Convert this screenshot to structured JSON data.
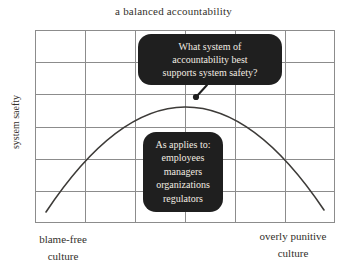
{
  "figure": {
    "title": "a balanced accountability",
    "y_axis_label": "system saefty",
    "x_axis_labels": {
      "left": [
        "blame-free",
        "culture"
      ],
      "right": [
        "overly punitive",
        "culture"
      ]
    },
    "callouts": {
      "question": {
        "lines": [
          "What system of",
          "accountability best",
          "supports system safety?"
        ]
      },
      "applies_to": {
        "lines": [
          "As applies to:",
          "employees",
          "managers",
          "organizations",
          "regulators"
        ]
      }
    },
    "grid": {
      "columns": 6,
      "rows": 6
    },
    "colors": {
      "background": "#ffffff",
      "text": "#33302b",
      "grid_line": "#8c8c8c",
      "curve": "#3d3b38",
      "callout_bg": "#1f1f1f",
      "callout_text": "#f2ece2"
    }
  }
}
